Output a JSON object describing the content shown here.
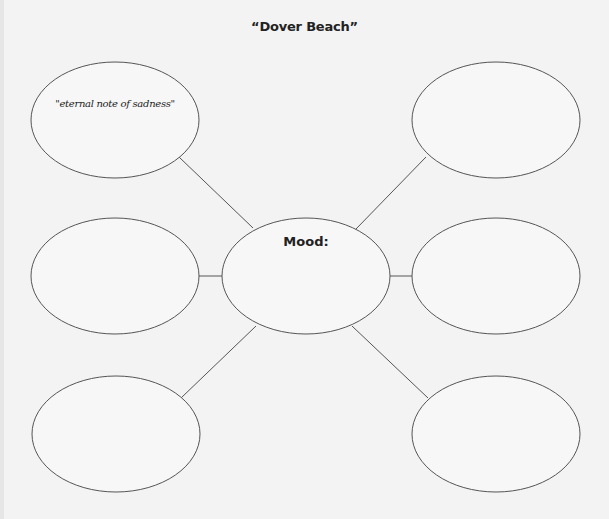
{
  "title": "“Dover Beach”",
  "center": {
    "label": "Mood:",
    "value": ""
  },
  "nodes": [
    {
      "id": "top-left",
      "text": "\"eternal note of sadness\""
    },
    {
      "id": "top-right",
      "text": ""
    },
    {
      "id": "middle-left",
      "text": ""
    },
    {
      "id": "middle-right",
      "text": ""
    },
    {
      "id": "bottom-left",
      "text": ""
    },
    {
      "id": "bottom-right",
      "text": ""
    }
  ],
  "colors": {
    "background": "#f3f3f3",
    "stroke": "#555555",
    "text": "#222222"
  }
}
